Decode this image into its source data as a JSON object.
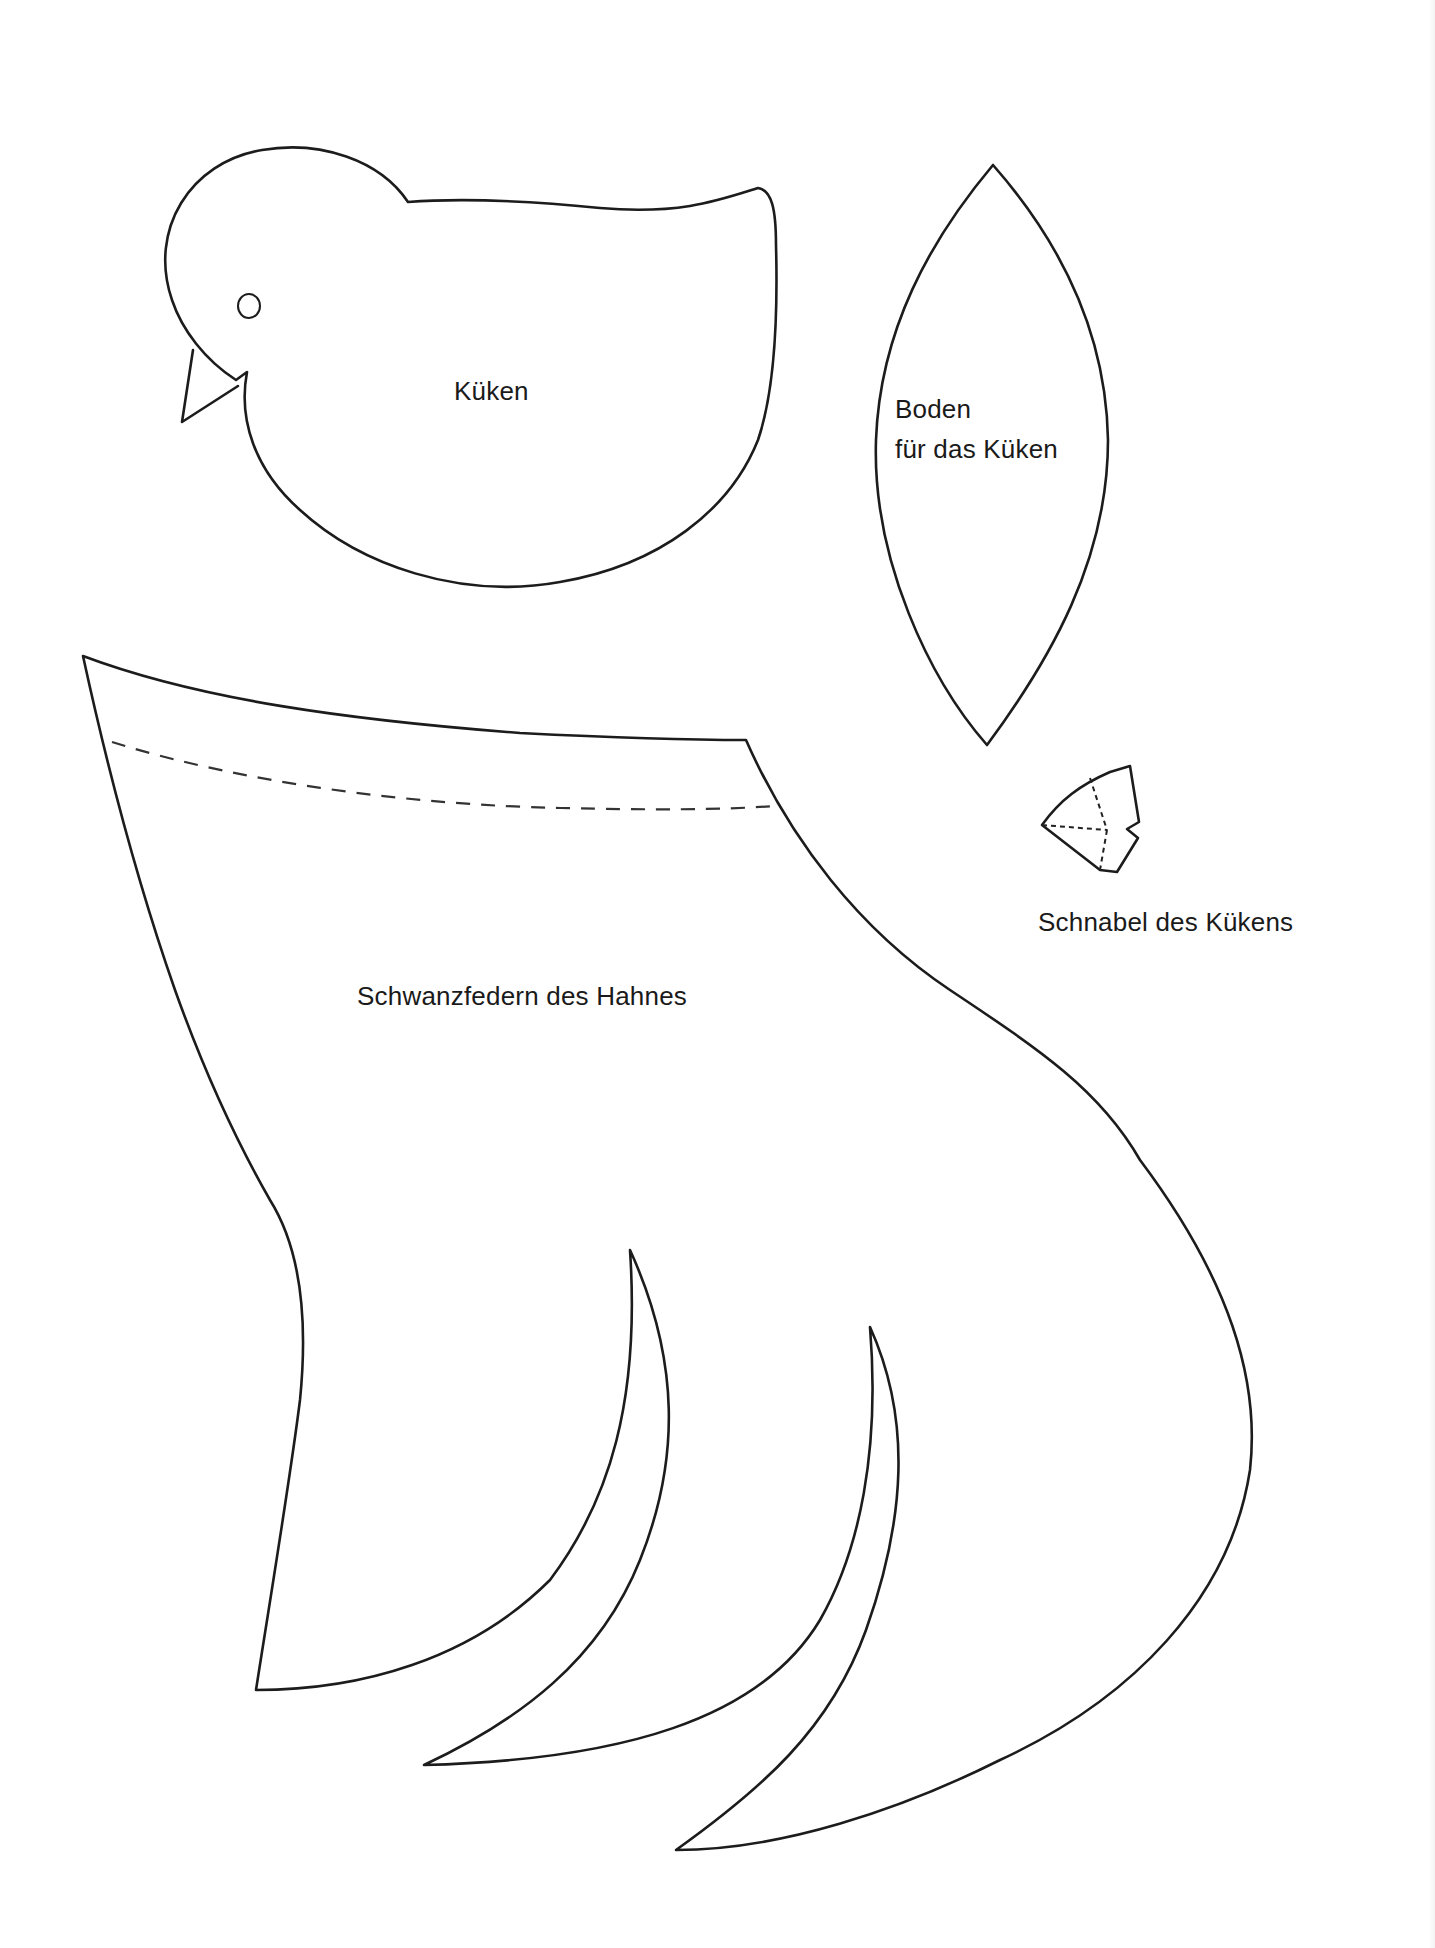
{
  "document": {
    "type": "craft cut-out template",
    "background_color": "#ffffff",
    "line_color": "#1c1c1c"
  },
  "pieces": [
    {
      "id": "chick",
      "label": "Küken",
      "features": [
        "eye-circle",
        "beak-triangle"
      ]
    },
    {
      "id": "chick-base",
      "label_line1": "Boden",
      "label_line2": "für das Küken",
      "shape": "lens"
    },
    {
      "id": "chick-beak",
      "label": "Schnabel des Kükens",
      "fold_lines": "dashed"
    },
    {
      "id": "rooster-tail",
      "label": "Schwanzfedern des Hahnes",
      "feather_count": 3,
      "fold_lines": "dashed"
    }
  ],
  "labels": {
    "chick": "Küken",
    "base_line1": "Boden",
    "base_line2": "für das Küken",
    "beak": "Schnabel des Kükens",
    "tail": "Schwanzfedern des Hahnes"
  }
}
